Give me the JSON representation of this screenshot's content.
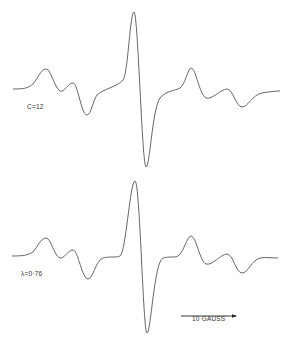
{
  "figure": {
    "type": "EPR spectra (first-derivative)",
    "top_spectrum": {
      "label": "C=12",
      "path": "M13,89 C25,89 28,88 33,84 C38,78 41,69 46,69 C51,69 54,87 60,91 C64,93 68,83 73,83 C78,83 81,115 87,115 C91,115 93,100 97,95 C103,89 117,87 123,80 C128,74 130,12 134,12 C138,12 142,167 146,167 C150,167 152,110 160,98 C167,90 175,91 180,88 C185,85 188,68 191,68 C196,68 199,94 206,98 C212,100 221,89 227,89 C233,89 236,107 242,107 C248,107 252,95 262,93 C268,92 274,91 280,91"
    },
    "bottom_spectrum": {
      "label": "λ=0·76",
      "path": "M12,256 C24,256 28,255 33,252 C38,246 41,238 46,238 C51,238 54,256 60,258 C64,259 68,250 73,250 C78,250 82,279 88,279 C93,279 96,260 103,258 C110,256 117,258 120,256 C126,252 130,181 135,181 C140,181 143,333 147,333 C151,333 154,262 163,258 C170,256 175,258 178,256 C184,252 187,236 191,236 C196,236 200,262 206,264 C212,266 221,254 227,254 C233,254 236,273 242,273 C248,273 252,260 260,258 C266,257 272,258 278,258"
    },
    "scale_bar": {
      "label": "10 GAUSS",
      "x1": 181,
      "x2": 236,
      "y": 316
    },
    "colors": {
      "trace": "#555555",
      "text": "#333333",
      "background": "#ffffff"
    }
  }
}
